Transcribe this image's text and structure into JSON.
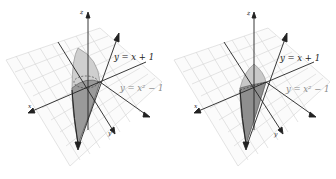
{
  "figures": [
    {
      "id": "left",
      "axes": {
        "x": "x",
        "y": "y",
        "z": "z"
      },
      "curves": [
        {
          "label": "y = x + 1"
        },
        {
          "label": "y = x² − 1"
        }
      ]
    },
    {
      "id": "right",
      "axes": {
        "x": "x",
        "y": "y",
        "z": "z"
      },
      "curves": [
        {
          "label": "y = x + 1"
        },
        {
          "label": "y = x² − 1"
        }
      ]
    }
  ],
  "colors": {
    "grid": "#d8d8d8",
    "axis": "#222222",
    "solid_light": "#c8c8c8",
    "solid_dark": "#6e6e6e"
  }
}
